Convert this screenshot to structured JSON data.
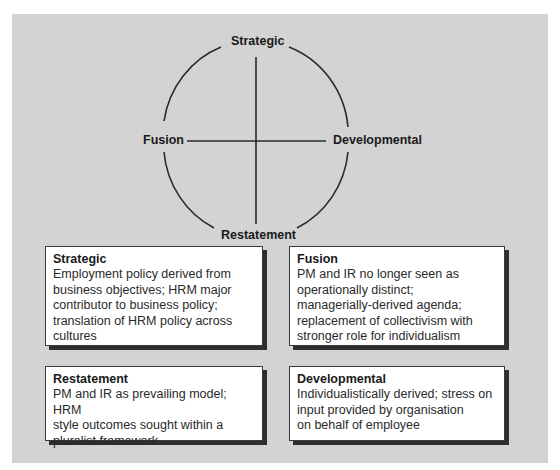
{
  "diagram": {
    "labels": {
      "top": "Strategic",
      "left": "Fusion",
      "right": "Developmental",
      "bottom": "Restatement"
    }
  },
  "boxes": [
    {
      "title": "Strategic",
      "lines": [
        "Employment policy derived from",
        "business objectives; HRM major",
        "contributor to business policy;",
        "translation of HRM policy across",
        "cultures"
      ]
    },
    {
      "title": "Fusion",
      "lines": [
        "PM and IR no longer seen as",
        "operationally distinct;",
        "managerially-derived agenda;",
        "replacement of collectivism with",
        "stronger role for individualism"
      ]
    },
    {
      "title": "Restatement",
      "lines": [
        "PM and IR as prevailing model; HRM",
        "style outcomes sought within a",
        "pluralist framework"
      ]
    },
    {
      "title": "Developmental",
      "lines": [
        "Individualistically derived; stress on",
        "input provided by organisation",
        "on behalf of employee"
      ]
    }
  ],
  "colors": {
    "panel": "#d3d3d3",
    "line": "#2a2a2a",
    "box_bg": "#ffffff",
    "shadow": "#2e2e2e"
  }
}
